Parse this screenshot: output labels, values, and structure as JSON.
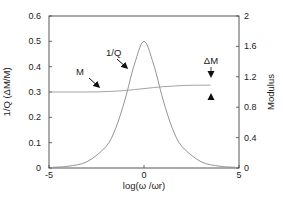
{
  "chart_data": {
    "type": "line",
    "title": "",
    "xlabel": "log(ω /ωr)",
    "ylabel_left": "1/Q (ΔM/M)",
    "ylabel_right": "Modulus",
    "xlim": [
      -5,
      5
    ],
    "ylim_left": [
      0,
      0.6
    ],
    "ylim_right": [
      0,
      2
    ],
    "x_ticks": [
      "-5",
      "0",
      "5"
    ],
    "y_ticks_left": [
      "0",
      "0.1",
      "0.2",
      "0.3",
      "0.4",
      "0.5",
      "0.6"
    ],
    "y_ticks_right": [
      "0",
      "0.4",
      "0.8",
      "1.2",
      "1.6",
      "2"
    ],
    "grid": false,
    "series": [
      {
        "name": "1/Q",
        "axis": "left",
        "x": [
          -4.8,
          -4,
          -3,
          -2,
          -1.5,
          -1,
          -0.5,
          0,
          0.5,
          1,
          1.5,
          2,
          3,
          4,
          4.8
        ],
        "values": [
          0.003,
          0.007,
          0.025,
          0.085,
          0.155,
          0.27,
          0.41,
          0.5,
          0.41,
          0.27,
          0.155,
          0.085,
          0.025,
          0.007,
          0.003
        ]
      },
      {
        "name": "M",
        "axis": "right",
        "x": [
          -5,
          -4,
          -3,
          -2,
          -1,
          0,
          1,
          2,
          3,
          3.5
        ],
        "values": [
          1.0,
          1.0,
          1.0,
          1.005,
          1.02,
          1.045,
          1.07,
          1.085,
          1.09,
          1.09
        ]
      }
    ],
    "annotations": [
      {
        "text": "1/Q",
        "target_series": "1/Q"
      },
      {
        "text": "M",
        "target_series": "M"
      },
      {
        "text": "ΔM",
        "description": "modulus defect marked by opposing arrows"
      }
    ]
  }
}
